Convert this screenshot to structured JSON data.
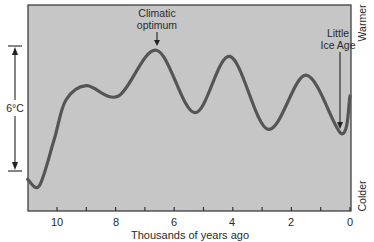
{
  "chart_data": {
    "type": "line",
    "title": "",
    "xlabel": "Thousands of years ago",
    "ylabel": "",
    "x_reversed": true,
    "xlim": [
      11,
      0
    ],
    "x_ticks": [
      10,
      9,
      8,
      7,
      6,
      5,
      4,
      3,
      2,
      1,
      0
    ],
    "x_tick_labels": [
      "10",
      "",
      "8",
      "",
      "6",
      "",
      "4",
      "",
      "2",
      "",
      "0"
    ],
    "y_scale_note": "relative temperature, 6°C bracket spans y=0 to y=6",
    "ylim": [
      -1.9,
      7.9
    ],
    "grid": false,
    "series": [
      {
        "name": "Temperature",
        "x": [
          11.0,
          10.6,
          10.1,
          9.7,
          9.0,
          7.9,
          6.6,
          5.3,
          4.1,
          2.8,
          1.5,
          0.3,
          0.0
        ],
        "y": [
          -0.4,
          -0.7,
          1.5,
          3.4,
          4.1,
          3.6,
          5.8,
          2.8,
          5.5,
          2.0,
          4.6,
          1.8,
          3.6
        ]
      }
    ],
    "annotations": [
      {
        "text": "Climatic optimum",
        "x": 6.6,
        "y": 5.8
      },
      {
        "text": "Little Ice Age",
        "x": 0.3,
        "y": 1.8
      }
    ],
    "scale_bracket": {
      "label": "6°C",
      "from": 0,
      "to": 6
    },
    "right_axis_labels": {
      "top": "Warmer",
      "bottom": "Colder"
    }
  },
  "labels": {
    "climatic_optimum_line1": "Climatic",
    "climatic_optimum_line2": "optimum",
    "little_ice_age_line1": "Little",
    "little_ice_age_line2": "Ice Age",
    "scale": "6°C",
    "warmer": "Warmer",
    "colder": "Colder",
    "xlabel": "Thousands of years ago",
    "tick_10": "10",
    "tick_8": "8",
    "tick_6": "6",
    "tick_4": "4",
    "tick_2": "2",
    "tick_0": "0"
  },
  "colors": {
    "plot_background": "#c6c6c6",
    "curve": "#555555",
    "axis": "#333333",
    "text": "#2a2a2a"
  }
}
